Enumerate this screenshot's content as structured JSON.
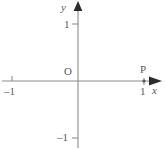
{
  "figure": {
    "name": "cartesian-axes-with-point-p",
    "width": 165,
    "height": 150,
    "background_color": "#ffffff",
    "line_color": "#8c8c8c",
    "text_color": "#595959"
  },
  "axes": {
    "x": {
      "label": "x",
      "origin_px": 78,
      "unit_px": 66,
      "arrow": "right",
      "ticks": [
        {
          "value": -1,
          "label": "–1",
          "x_px": 12
        },
        {
          "value": 1,
          "label": "1",
          "x_px": 144
        }
      ]
    },
    "y": {
      "label": "y",
      "origin_px": 81,
      "unit_px": 57,
      "arrow": "up",
      "ticks": [
        {
          "value": 1,
          "label": "1",
          "y_px": 24
        },
        {
          "value": -1,
          "label": "–1",
          "y_px": 138
        }
      ]
    }
  },
  "annotations": {
    "origin_label": "O",
    "point_label": "P",
    "point_coords": {
      "x": 1,
      "y": 0
    }
  }
}
